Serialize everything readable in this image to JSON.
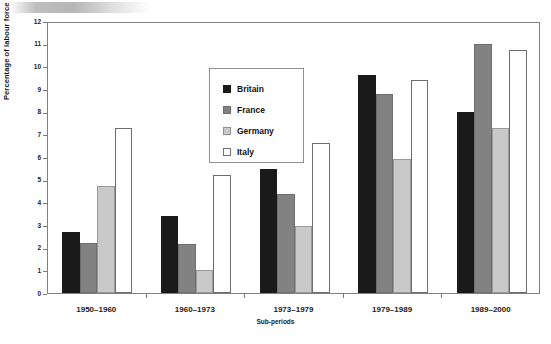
{
  "chart_data": {
    "type": "bar",
    "title": "",
    "xlabel": "Sub-periods",
    "ylabel": "Percentage of labour force",
    "ylim": [
      0,
      12
    ],
    "yticks": [
      0,
      1,
      2,
      3,
      4,
      5,
      6,
      7,
      8,
      9,
      10,
      11,
      12
    ],
    "ytick_labels": [
      "0",
      "1",
      "2",
      "3",
      "4",
      "5",
      "6",
      "7",
      "8",
      "9",
      "10",
      "11",
      "12"
    ],
    "grid": false,
    "legend_position": "upper center",
    "categories": [
      "1950–1960",
      "1960–1973",
      "1973–1979",
      "1979–1989",
      "1989–2000"
    ],
    "series": [
      {
        "name": "Britain",
        "color": "#1a1a1a",
        "values": [
          2.7,
          3.4,
          5.45,
          9.6,
          8.0
        ]
      },
      {
        "name": "France",
        "color": "#828282",
        "values": [
          2.2,
          2.15,
          4.35,
          8.8,
          11.0
        ]
      },
      {
        "name": "Germany",
        "color": "#c9c9c9",
        "values": [
          4.7,
          1.0,
          2.95,
          5.9,
          7.3
        ]
      },
      {
        "name": "Italy",
        "color": "#ffffff",
        "values": [
          7.3,
          5.2,
          6.6,
          9.4,
          10.7
        ]
      }
    ]
  },
  "legend": {
    "items": [
      {
        "label": "Britain",
        "swatch": "britain"
      },
      {
        "label": "France",
        "swatch": "france"
      },
      {
        "label": "Germany",
        "swatch": "germany"
      },
      {
        "label": "Italy",
        "swatch": "italy"
      }
    ]
  },
  "decor": {
    "top_strip": "gradient-strip"
  }
}
